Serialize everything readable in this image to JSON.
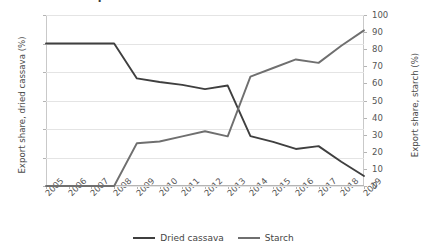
{
  "chart_data": {
    "type": "line",
    "title": "Export shares of dried cassava and starch",
    "x": [
      2005,
      2006,
      2007,
      2008,
      2009,
      2010,
      2011,
      2012,
      2013,
      2014,
      2015,
      2016,
      2017,
      2018,
      2019
    ],
    "xlabel": "",
    "grid": true,
    "legend_position": "bottom",
    "axes": {
      "left": {
        "label": "Export share, dried cassava (%)",
        "ticks": [
          0,
          20,
          40,
          60,
          80,
          100,
          120
        ],
        "ylim": [
          0,
          120
        ]
      },
      "right": {
        "label": "Export share, starch (%)",
        "ticks": [
          0,
          10,
          20,
          30,
          40,
          50,
          60,
          70,
          80,
          90,
          100
        ],
        "ylim": [
          0,
          100
        ]
      }
    },
    "series": [
      {
        "name": "Dried cassava",
        "axis": "left",
        "color": "#3f3f3f",
        "values": [
          100,
          100,
          100,
          100,
          75.5,
          73,
          71,
          68,
          70.5,
          35,
          31,
          26,
          28,
          17,
          7
        ]
      },
      {
        "name": "Starch",
        "axis": "right",
        "color": "#6f6f6f",
        "values": [
          0,
          0,
          0,
          0,
          25,
          26,
          29,
          32,
          29,
          64,
          69,
          74,
          72,
          82,
          91
        ]
      }
    ]
  },
  "legend": {
    "items": [
      {
        "label": "Dried cassava",
        "color": "#3f3f3f"
      },
      {
        "label": "Starch",
        "color": "#6f6f6f"
      }
    ]
  }
}
